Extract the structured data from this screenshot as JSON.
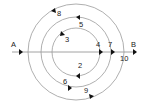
{
  "diagram": {
    "center": [
      76,
      52
    ],
    "line": {
      "x1": 12,
      "x2": 136,
      "y": 52,
      "color": "#8a8a8a"
    },
    "circles": [
      {
        "name": "inner",
        "r": 24
      },
      {
        "name": "middle",
        "r": 35
      },
      {
        "name": "outer",
        "r": 48
      }
    ],
    "circle_color": "#9a9a9a",
    "arrow_color": "#111111",
    "endpoints": {
      "start": "A",
      "end": "B"
    },
    "labels": {
      "A": "A",
      "B": "B",
      "n1": "2",
      "n2": "3",
      "n3": "4",
      "n4": "5",
      "n5": "6",
      "n6": "7",
      "n7": "8",
      "n8": "9",
      "n9": "10"
    }
  }
}
